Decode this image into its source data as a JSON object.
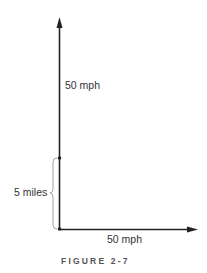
{
  "diagram": {
    "vertical_vector_label": "50 mph",
    "horizontal_vector_label": "50 mph",
    "distance_label": "5 miles",
    "caption": "FIGURE 2-7",
    "colors": {
      "line": "#222222",
      "brace": "#999999",
      "text": "#333333",
      "caption": "#555555"
    }
  }
}
